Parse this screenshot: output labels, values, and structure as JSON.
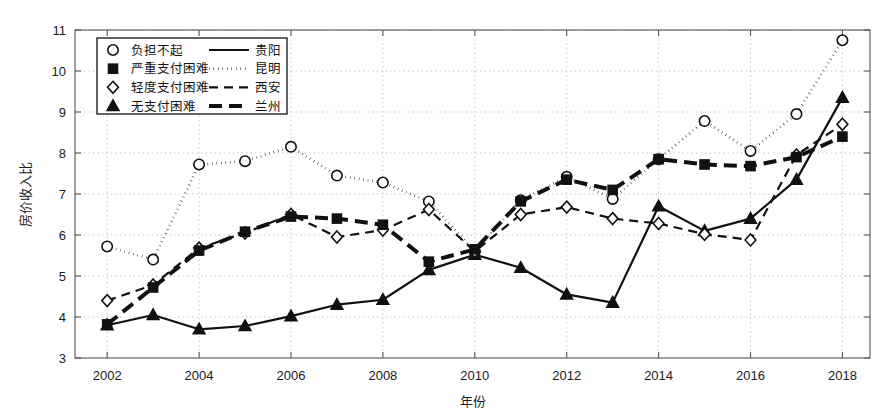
{
  "chart_data": {
    "type": "line",
    "title": "",
    "xlabel": "年份",
    "ylabel": "房价收入比",
    "xlim": [
      2001.3,
      2018.6
    ],
    "ylim": [
      3,
      11
    ],
    "xticks": [
      2002,
      2004,
      2006,
      2008,
      2010,
      2012,
      2014,
      2016,
      2018
    ],
    "xticklabels": [
      "2002",
      "2004",
      "2006",
      "2008",
      "2010",
      "2012",
      "2014",
      "2016",
      "2018"
    ],
    "yticks": [
      3,
      4,
      5,
      6,
      7,
      8,
      9,
      10,
      11
    ],
    "yticklabels": [
      "3",
      "4",
      "5",
      "6",
      "7",
      "8",
      "9",
      "10",
      "11"
    ],
    "grid": true,
    "grid_style": "dotted",
    "legend_position": "upper-left",
    "x": [
      2002,
      2003,
      2004,
      2005,
      2006,
      2007,
      2008,
      2009,
      2010,
      2011,
      2012,
      2013,
      2014,
      2015,
      2016,
      2017,
      2018
    ],
    "series": [
      {
        "name": "贵阳",
        "marker": "triangle",
        "marker_label": "无支付困难",
        "line": "solid",
        "values": [
          3.8,
          4.05,
          3.7,
          3.78,
          4.02,
          4.3,
          4.42,
          5.15,
          5.52,
          5.2,
          4.55,
          4.35,
          6.7,
          6.1,
          6.4,
          7.35,
          9.35
        ]
      },
      {
        "name": "昆明",
        "marker": "circle",
        "marker_label": "负担不起",
        "line": "dotted",
        "values": [
          5.72,
          5.4,
          7.72,
          7.8,
          8.15,
          7.45,
          7.28,
          6.82,
          5.6,
          6.85,
          7.42,
          6.88,
          7.85,
          8.78,
          8.05,
          8.95,
          10.75
        ]
      },
      {
        "name": "西安",
        "marker": "diamond",
        "marker_label": "轻度支付困难",
        "line": "dashed",
        "values": [
          4.4,
          4.78,
          5.68,
          6.05,
          6.5,
          5.95,
          6.12,
          6.62,
          5.6,
          6.5,
          6.68,
          6.4,
          6.28,
          6.02,
          5.88,
          7.95,
          8.7
        ]
      },
      {
        "name": "兰州",
        "marker": "square",
        "marker_label": "严重支付困难",
        "line": "thick-dashed",
        "values": [
          3.82,
          4.72,
          5.62,
          6.08,
          6.45,
          6.4,
          6.25,
          5.35,
          5.65,
          6.82,
          7.35,
          7.1,
          7.85,
          7.72,
          7.68,
          7.9,
          8.4
        ]
      }
    ]
  },
  "legend": {
    "marker_entries": [
      {
        "marker": "circle",
        "label": "负担不起"
      },
      {
        "marker": "square",
        "label": "严重支付困难"
      },
      {
        "marker": "diamond",
        "label": "轻度支付困难"
      },
      {
        "marker": "triangle",
        "label": "无支付困难"
      }
    ],
    "line_entries": [
      {
        "style": "solid",
        "label": "贵阳"
      },
      {
        "style": "dotted",
        "label": "昆明"
      },
      {
        "style": "dashed",
        "label": "西安"
      },
      {
        "style": "thick-dashed",
        "label": "兰州"
      }
    ]
  },
  "colors": {
    "ink": "#111111",
    "grid": "#c9c9c9",
    "axis": "#555555",
    "background": "#ffffff"
  }
}
